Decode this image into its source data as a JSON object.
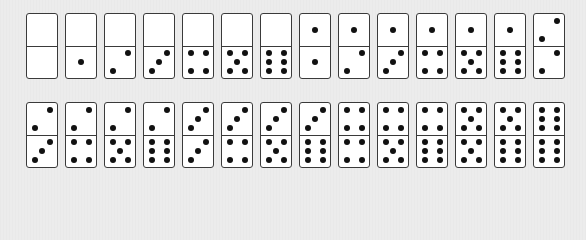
{
  "colors": {
    "background": "#ececec",
    "tile": "#ffffff",
    "border": "#3a3a3a",
    "pip": "#111111"
  },
  "rows": [
    {
      "tiles": [
        [
          0,
          0
        ],
        [
          0,
          1
        ],
        [
          0,
          2
        ],
        [
          0,
          3
        ],
        [
          0,
          4
        ],
        [
          0,
          5
        ],
        [
          0,
          6
        ],
        [
          1,
          1
        ],
        [
          1,
          2
        ],
        [
          1,
          3
        ],
        [
          1,
          4
        ],
        [
          1,
          5
        ],
        [
          1,
          6
        ],
        [
          2,
          2
        ]
      ]
    },
    {
      "tiles": [
        [
          2,
          3
        ],
        [
          2,
          4
        ],
        [
          2,
          5
        ],
        [
          2,
          6
        ],
        [
          3,
          3
        ],
        [
          3,
          4
        ],
        [
          3,
          5
        ],
        [
          3,
          6
        ],
        [
          4,
          4
        ],
        [
          4,
          5
        ],
        [
          4,
          6
        ],
        [
          5,
          5
        ],
        [
          5,
          6
        ],
        [
          6,
          6
        ]
      ]
    }
  ]
}
